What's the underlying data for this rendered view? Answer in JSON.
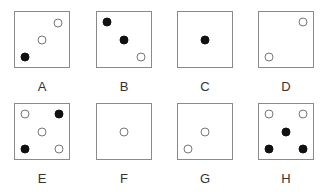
{
  "panels": [
    {
      "label": "A",
      "col": 0,
      "row": 0,
      "dots": [
        {
          "x": 0.8,
          "y": 0.2,
          "filled": false
        },
        {
          "x": 0.5,
          "y": 0.5,
          "filled": false
        },
        {
          "x": 0.18,
          "y": 0.82,
          "filled": true
        }
      ]
    },
    {
      "label": "B",
      "col": 1,
      "row": 0,
      "dots": [
        {
          "x": 0.18,
          "y": 0.18,
          "filled": true
        },
        {
          "x": 0.5,
          "y": 0.5,
          "filled": true
        },
        {
          "x": 0.82,
          "y": 0.82,
          "filled": false
        }
      ]
    },
    {
      "label": "C",
      "col": 2,
      "row": 0,
      "dots": [
        {
          "x": 0.5,
          "y": 0.5,
          "filled": true
        }
      ]
    },
    {
      "label": "D",
      "col": 3,
      "row": 0,
      "dots": [
        {
          "x": 0.82,
          "y": 0.18,
          "filled": false
        },
        {
          "x": 0.18,
          "y": 0.82,
          "filled": false
        }
      ]
    },
    {
      "label": "E",
      "col": 0,
      "row": 1,
      "dots": [
        {
          "x": 0.18,
          "y": 0.18,
          "filled": false
        },
        {
          "x": 0.82,
          "y": 0.18,
          "filled": true
        },
        {
          "x": 0.5,
          "y": 0.5,
          "filled": false
        },
        {
          "x": 0.18,
          "y": 0.82,
          "filled": true
        },
        {
          "x": 0.82,
          "y": 0.82,
          "filled": false
        }
      ]
    },
    {
      "label": "F",
      "col": 1,
      "row": 1,
      "dots": [
        {
          "x": 0.5,
          "y": 0.5,
          "filled": false
        }
      ]
    },
    {
      "label": "G",
      "col": 2,
      "row": 1,
      "dots": [
        {
          "x": 0.5,
          "y": 0.5,
          "filled": false
        },
        {
          "x": 0.18,
          "y": 0.82,
          "filled": false
        }
      ]
    },
    {
      "label": "H",
      "col": 3,
      "row": 1,
      "dots": [
        {
          "x": 0.18,
          "y": 0.18,
          "filled": false
        },
        {
          "x": 0.82,
          "y": 0.18,
          "filled": false
        },
        {
          "x": 0.5,
          "y": 0.5,
          "filled": true
        },
        {
          "x": 0.18,
          "y": 0.82,
          "filled": true
        },
        {
          "x": 0.82,
          "y": 0.82,
          "filled": true
        }
      ]
    }
  ],
  "layout": {
    "col_x": [
      14,
      96,
      177,
      258
    ],
    "row_y": [
      11,
      103
    ]
  }
}
